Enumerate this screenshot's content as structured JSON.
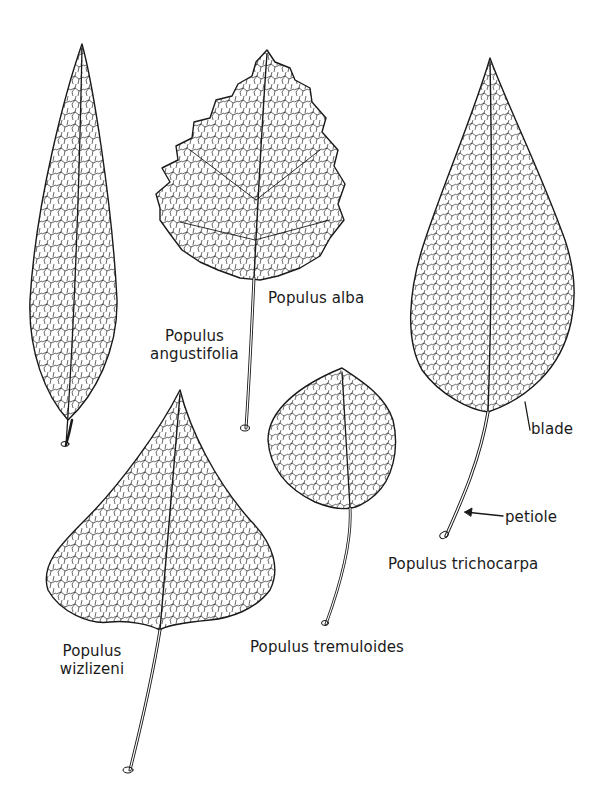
{
  "figure": {
    "stroke_color": "#1a1a1a",
    "background": "#ffffff"
  },
  "leaves": [
    {
      "id": "angustifolia",
      "label_line1": "Populus",
      "label_line2": "angustifolia"
    },
    {
      "id": "alba",
      "label": "Populus alba"
    },
    {
      "id": "trichocarpa",
      "label": "Populus trichocarpa"
    },
    {
      "id": "tremuloides",
      "label": "Populus tremuloides"
    },
    {
      "id": "wizlizeni",
      "label_line1": "Populus",
      "label_line2": "wizlizeni"
    }
  ],
  "callouts": {
    "blade": "blade",
    "petiole": "petiole"
  }
}
